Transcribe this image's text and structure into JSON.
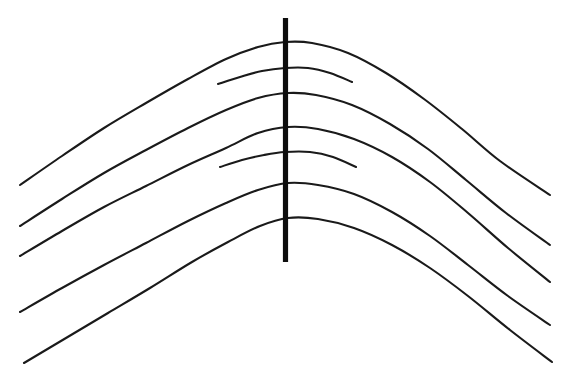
{
  "figure": {
    "type": "geometric-optical-illusion",
    "background_color": "#ffffff",
    "stroke_color": "#1a1a1a",
    "vertical_line_color": "#0d0d0d",
    "canvas": {
      "width": 564,
      "height": 371
    }
  },
  "chart_data": {
    "type": "line",
    "subtitle": "",
    "xlabel": "",
    "ylabel": "",
    "xlim": [
      0,
      564
    ],
    "ylim": [
      371,
      0
    ],
    "grid": false,
    "legend": "none",
    "annotations": [],
    "axis_note": "image pixel coordinates, y increases downward",
    "series": [
      {
        "name": "long-arch-1",
        "kind": "long",
        "stroke_width": 2.1,
        "apex": [
          285,
          42
        ],
        "left_end": [
          20,
          185
        ],
        "right_end": [
          550,
          195
        ],
        "crossing_y_at_vertical": 42,
        "points": [
          [
            20,
            185
          ],
          [
            62,
            156
          ],
          [
            104,
            128
          ],
          [
            146,
            103
          ],
          [
            188,
            79
          ],
          [
            226,
            59
          ],
          [
            258,
            47
          ],
          [
            285,
            42
          ],
          [
            312,
            43
          ],
          [
            348,
            53
          ],
          [
            386,
            73
          ],
          [
            424,
            99
          ],
          [
            462,
            129
          ],
          [
            500,
            161
          ],
          [
            550,
            195
          ]
        ]
      },
      {
        "name": "short-arc-1",
        "kind": "short",
        "stroke_width": 2.1,
        "apex": [
          290,
          67
        ],
        "left_end": [
          218,
          84
        ],
        "right_end": [
          352,
          82
        ],
        "crossing_y_at_vertical": 68,
        "points": [
          [
            218,
            84
          ],
          [
            240,
            77
          ],
          [
            262,
            71
          ],
          [
            285,
            68
          ],
          [
            308,
            68
          ],
          [
            330,
            73
          ],
          [
            352,
            82
          ]
        ]
      },
      {
        "name": "long-arch-2",
        "kind": "long",
        "stroke_width": 2.1,
        "apex": [
          288,
          93
        ],
        "left_end": [
          20,
          226
        ],
        "right_end": [
          550,
          245
        ],
        "crossing_y_at_vertical": 93,
        "points": [
          [
            20,
            226
          ],
          [
            62,
            199
          ],
          [
            104,
            173
          ],
          [
            146,
            150
          ],
          [
            188,
            128
          ],
          [
            226,
            110
          ],
          [
            258,
            98
          ],
          [
            288,
            93
          ],
          [
            316,
            95
          ],
          [
            352,
            105
          ],
          [
            390,
            124
          ],
          [
            428,
            149
          ],
          [
            466,
            180
          ],
          [
            506,
            213
          ],
          [
            550,
            245
          ]
        ]
      },
      {
        "name": "long-arch-3",
        "kind": "long",
        "stroke_width": 2.1,
        "apex": [
          288,
          127
        ],
        "left_end": [
          20,
          256
        ],
        "right_end": [
          550,
          282
        ],
        "crossing_y_at_vertical": 127,
        "points": [
          [
            20,
            256
          ],
          [
            62,
            231
          ],
          [
            104,
            207
          ],
          [
            146,
            186
          ],
          [
            188,
            165
          ],
          [
            226,
            148
          ],
          [
            258,
            133
          ],
          [
            288,
            127
          ],
          [
            318,
            129
          ],
          [
            354,
            139
          ],
          [
            392,
            157
          ],
          [
            430,
            182
          ],
          [
            468,
            213
          ],
          [
            508,
            248
          ],
          [
            550,
            282
          ]
        ]
      },
      {
        "name": "short-arc-2",
        "kind": "short",
        "stroke_width": 2.1,
        "apex": [
          290,
          152
        ],
        "left_end": [
          220,
          167
        ],
        "right_end": [
          356,
          167
        ],
        "crossing_y_at_vertical": 152,
        "points": [
          [
            220,
            167
          ],
          [
            242,
            160
          ],
          [
            264,
            155
          ],
          [
            285,
            152
          ],
          [
            310,
            152
          ],
          [
            333,
            157
          ],
          [
            356,
            167
          ]
        ]
      },
      {
        "name": "long-arch-4",
        "kind": "long",
        "stroke_width": 2.1,
        "apex": [
          288,
          183
        ],
        "left_end": [
          20,
          312
        ],
        "right_end": [
          550,
          325
        ],
        "crossing_y_at_vertical": 183,
        "points": [
          [
            20,
            312
          ],
          [
            62,
            288
          ],
          [
            104,
            265
          ],
          [
            146,
            243
          ],
          [
            188,
            221
          ],
          [
            226,
            203
          ],
          [
            258,
            190
          ],
          [
            288,
            183
          ],
          [
            318,
            185
          ],
          [
            354,
            194
          ],
          [
            392,
            212
          ],
          [
            430,
            236
          ],
          [
            468,
            265
          ],
          [
            508,
            296
          ],
          [
            550,
            325
          ]
        ]
      },
      {
        "name": "long-arch-5",
        "kind": "long",
        "stroke_width": 2.1,
        "apex": [
          288,
          218
        ],
        "left_end": [
          24,
          363
        ],
        "right_end": [
          552,
          362
        ],
        "crossing_y_at_vertical": 218,
        "points": [
          [
            24,
            363
          ],
          [
            66,
            338
          ],
          [
            108,
            313
          ],
          [
            150,
            288
          ],
          [
            192,
            262
          ],
          [
            228,
            242
          ],
          [
            260,
            226
          ],
          [
            288,
            218
          ],
          [
            318,
            219
          ],
          [
            354,
            228
          ],
          [
            392,
            245
          ],
          [
            430,
            268
          ],
          [
            468,
            296
          ],
          [
            510,
            330
          ],
          [
            552,
            362
          ]
        ]
      }
    ],
    "vertical_line": {
      "name": "vertical-line",
      "x": 285.5,
      "y_top": 18,
      "y_bottom": 262,
      "stroke_width": 5.2,
      "color": "#0d0d0d"
    },
    "counts": {
      "long_arches": 5,
      "short_arcs": 2,
      "vertical_lines": 1,
      "total_strokes": 8
    }
  }
}
